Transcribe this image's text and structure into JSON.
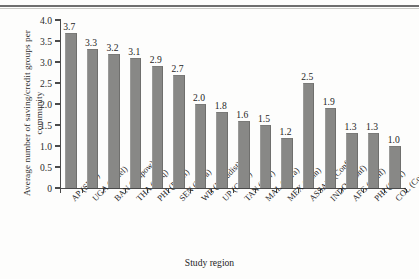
{
  "chart_data": {
    "type": "bar",
    "title": "",
    "xlabel": "Study region",
    "ylabel": "Average number of saving/credit groups per community",
    "categories": [
      "AP (SHG)",
      "UGA (Panel)",
      "BAN (Empow)",
      "THA (Ineq)",
      "PHI (Panel)",
      "SEN (Infra)",
      "WB (Landdist)",
      "UP (Caste)",
      "TAN (Ruv)",
      "MAL (Infra)",
      "MEX (Ethn)",
      "ASSAM (Conf)",
      "INDO (Conf)",
      "AFG (Conf)",
      "PHI (Conf)",
      "COL (Conf)"
    ],
    "values": [
      3.7,
      3.3,
      3.2,
      3.1,
      2.9,
      2.7,
      2.0,
      1.8,
      1.6,
      1.5,
      1.2,
      2.5,
      1.9,
      1.3,
      1.3,
      1.0
    ],
    "value_labels": [
      "3.7",
      "3.3",
      "3.2",
      "3.1",
      "2.9",
      "2.7",
      "2.0",
      "1.8",
      "1.6",
      "1.5",
      "1.2",
      "2.5",
      "1.9",
      "1.3",
      "1.3",
      "1.0"
    ],
    "ylim": [
      0,
      4.0
    ],
    "yticks": [
      0,
      0.5,
      1.0,
      1.5,
      2.0,
      2.5,
      3.0,
      3.5,
      4.0
    ],
    "ytick_labels": [
      "0",
      "0.5",
      "1.0",
      "1.5",
      "2.0",
      "2.5",
      "3.0",
      "3.5",
      "4.0"
    ],
    "grid": false,
    "legend": null,
    "bar_color": "#888886",
    "axis_color": "#4a4a4a"
  }
}
